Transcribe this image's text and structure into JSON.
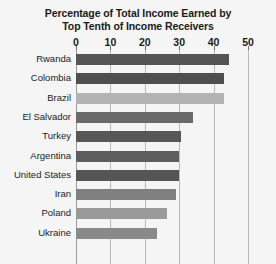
{
  "chart_data": {
    "type": "bar",
    "orientation": "horizontal",
    "title": "Percentage of Total Income Earned by Top Tenth of Income Receivers",
    "title_lines": [
      "Percentage of Total Income Earned by",
      "Top Tenth of Income Receivers"
    ],
    "xlabel": "",
    "ylabel": "",
    "xlim": [
      0,
      50
    ],
    "xticks": [
      0,
      10,
      20,
      30,
      40,
      50
    ],
    "xtick_labels": [
      "0",
      "10",
      "20",
      "30",
      "40",
      "50"
    ],
    "grid": "vertical",
    "legend": "none",
    "categories": [
      "Rwanda",
      "Colombia",
      "Brazil",
      "El Salvador",
      "Turkey",
      "Argentina",
      "United States",
      "Iran",
      "Poland",
      "Ukraine"
    ],
    "values": [
      44.5,
      43,
      43,
      34,
      30.5,
      30,
      30,
      29,
      26.5,
      23.5
    ],
    "bar_colors": [
      "#555555",
      "#4f4f4f",
      "#b3b3b3",
      "#6a6a6a",
      "#575757",
      "#5e5e5e",
      "#555555",
      "#808080",
      "#9a9a9a",
      "#8a8a8a"
    ]
  },
  "colors": {
    "background": "#f5f5f5",
    "gridline": "#b9b9b9",
    "axis": "#9a9a9a",
    "text": "#1b1b1b"
  }
}
